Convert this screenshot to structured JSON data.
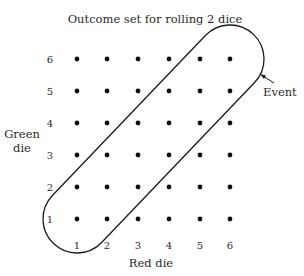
{
  "title": "Outcome set for rolling 2 dice",
  "x_axis": {
    "label": "Red die",
    "ticks": [
      "1",
      "2",
      "3",
      "4",
      "5",
      "6"
    ]
  },
  "y_axis": {
    "label_line1": "Green",
    "label_line2": "die",
    "ticks": [
      "1",
      "2",
      "3",
      "4",
      "5",
      "6"
    ]
  },
  "event": {
    "label": "Event",
    "description": "Outcomes where both dice show the same value (doubles)",
    "outcomes": [
      [
        1,
        1
      ],
      [
        2,
        2
      ],
      [
        3,
        3
      ],
      [
        4,
        4
      ],
      [
        5,
        5
      ],
      [
        6,
        6
      ]
    ]
  },
  "grid": {
    "rows": 6,
    "cols": 6,
    "dot_color": "#111111"
  },
  "colors": {
    "stroke": "#1a1a1a",
    "text": "#2a2a2a"
  }
}
